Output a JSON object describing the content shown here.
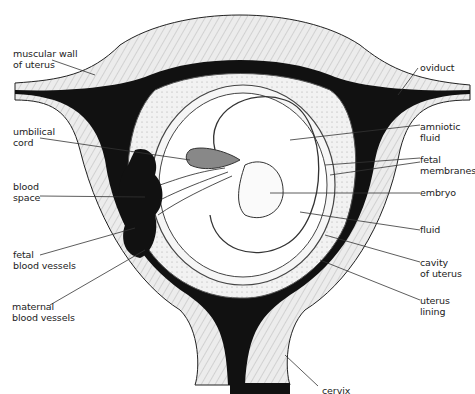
{
  "diagram": {
    "colors": {
      "ink": "#111111",
      "tissue": "#e6e6e6",
      "hatch": "#9a9a9a",
      "background": "#ffffff"
    },
    "labels": {
      "muscular_wall": "muscular wall\nof uterus",
      "umbilical_cord": "umbilical\ncord",
      "blood_space": "blood\nspace",
      "fetal_blood_vessels": "fetal\nblood vessels",
      "maternal_blood_vessels": "maternal\nblood vessels",
      "oviduct": "oviduct",
      "amniotic_fluid": "amniotic\nfluid",
      "fetal_membranes": "fetal\nmembranes",
      "embryo": "embryo",
      "fluid": "fluid",
      "cavity_of_uterus": "cavity\nof uterus",
      "uterus_lining": "uterus\nlining",
      "cervix": "cervix"
    }
  }
}
